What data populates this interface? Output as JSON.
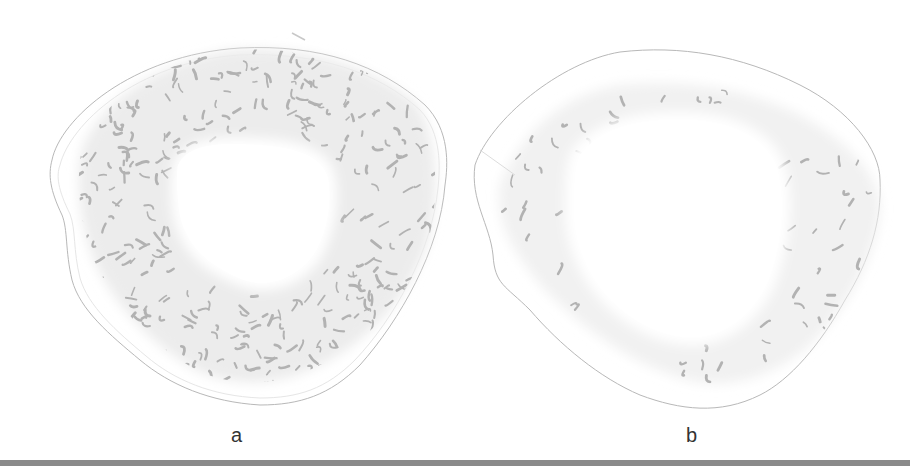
{
  "figure": {
    "panels": [
      {
        "id": "a",
        "label": "a",
        "trabecular_density": "dense",
        "mark_count": 420
      },
      {
        "id": "b",
        "label": "b",
        "trabecular_density": "sparse",
        "mark_count": 95
      }
    ]
  },
  "colors": {
    "background": "#ffffff",
    "outline": "#b8b8b8",
    "trabecular_zone": "#ececec",
    "trabecula_mark": "#b2b2b2",
    "bottom_bar": "#8a8a8a",
    "label_text": "#333333"
  }
}
